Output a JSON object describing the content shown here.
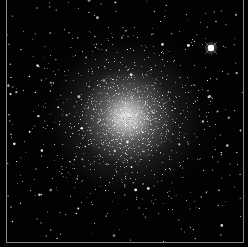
{
  "image": {
    "subject": "globular star cluster",
    "width": 248,
    "height": 247,
    "background_color": "#020202",
    "frame_color": "#8a8a8a",
    "cluster_core": {
      "x": 127,
      "y": 117
    },
    "bright_star": {
      "x": 211,
      "y": 48
    }
  }
}
